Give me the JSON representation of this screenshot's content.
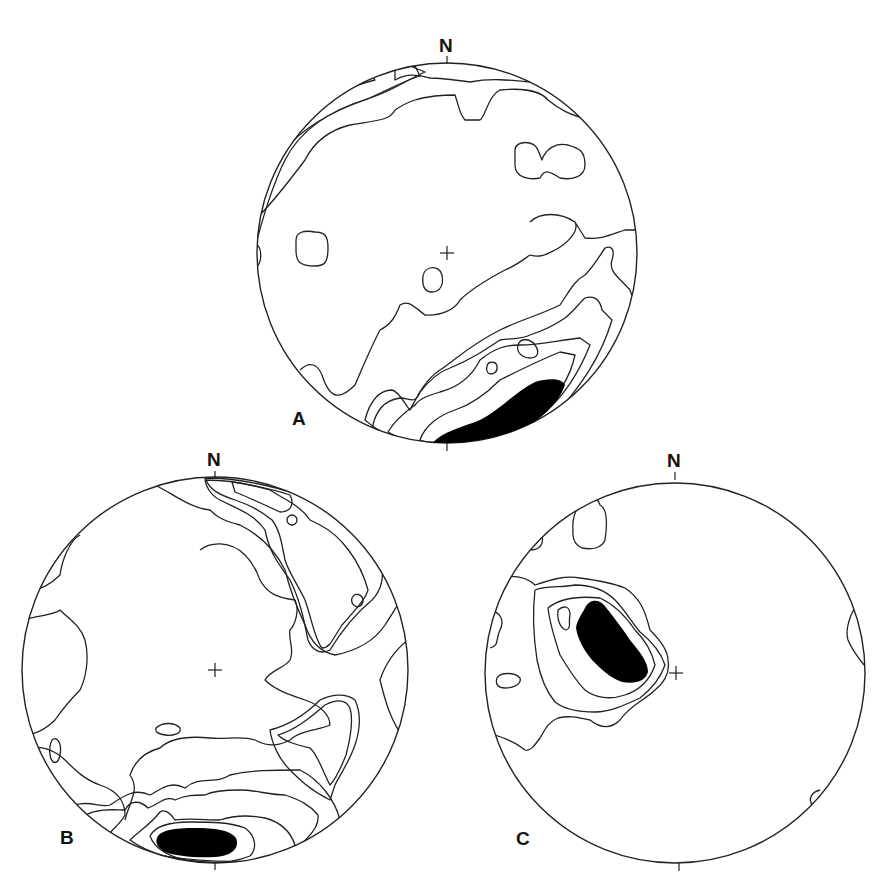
{
  "figure": {
    "type": "stereonet contour diagrams (equal-area, lower hemisphere)",
    "panels": [
      {
        "id": "A",
        "label": "A",
        "north_label": "N",
        "center": [
          447,
          253
        ],
        "radius": 190,
        "description": "Girdle-like concentration along southern margin; maximum (black) near S edge, secondary concentration along NW margin"
      },
      {
        "id": "B",
        "label": "B",
        "north_label": "N",
        "center": [
          215,
          670
        ],
        "radius": 193,
        "description": "Maximum (black) at S margin; hatched concentrations at NE margin and SE; weaker girdle"
      },
      {
        "id": "C",
        "label": "C",
        "north_label": "N",
        "center": [
          675,
          673
        ],
        "radius": 190,
        "description": "Single strong maximum (black) in NW quadrant near center; few weak outliers near margins"
      }
    ],
    "contour_patterns": [
      {
        "level": 1,
        "pattern": "open contour line",
        "fill": "#ffffff"
      },
      {
        "level": 2,
        "pattern": "fine stipple",
        "fill": "#e6e6e6"
      },
      {
        "level": 3,
        "pattern": "vertical hatching",
        "fill": "#bfbfbf"
      },
      {
        "level": 4,
        "pattern": "coarse dots",
        "fill": "#d0d0d0"
      },
      {
        "level": 5,
        "pattern": "cross-hatch grid",
        "fill": "#8a8a8a"
      },
      {
        "level": 6,
        "pattern": "solid black",
        "fill": "#000000"
      }
    ]
  }
}
